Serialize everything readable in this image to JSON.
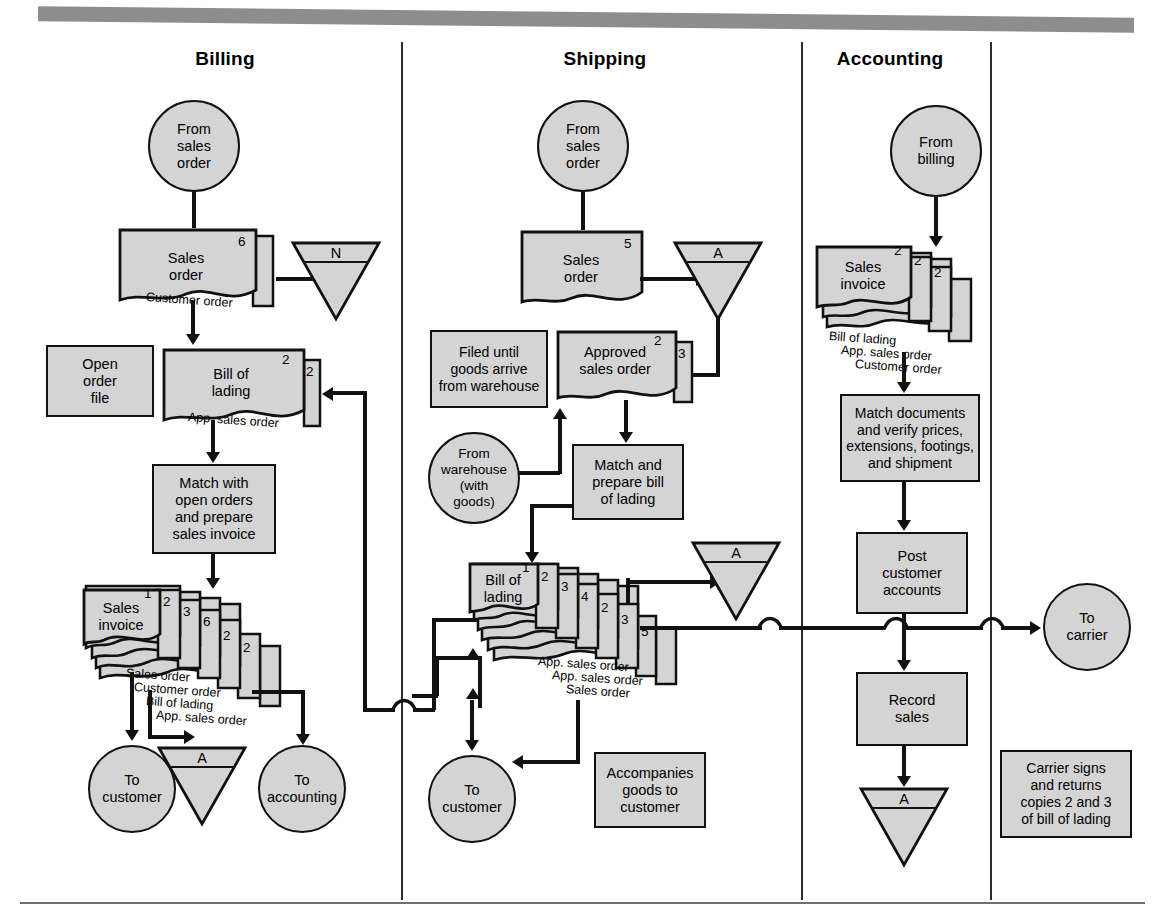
{
  "figure": {
    "columns": [
      {
        "id": "billing",
        "label": "Billing"
      },
      {
        "id": "shipping",
        "label": "Shipping"
      },
      {
        "id": "accounting",
        "label": "Accounting"
      }
    ]
  },
  "billing": {
    "from_sales_order": "From\nsales\norder",
    "sales_order_doc": {
      "title": "Sales\norder",
      "copies": [
        "6"
      ],
      "labels": [
        "Customer order"
      ]
    },
    "file_n": "N",
    "open_order_file": "Open\norder\nfile",
    "bill_of_lading_doc": {
      "title": "Bill of\nlading",
      "copies": [
        "2",
        "2"
      ],
      "labels": [
        "App. sales order"
      ]
    },
    "match_process": "Match with\nopen orders\nand prepare\nsales invoice",
    "sales_invoice_doc": {
      "title": "Sales\ninvoice",
      "copies": [
        "1",
        "2",
        "3",
        "6",
        "2",
        "2"
      ],
      "labels": [
        "Sales order",
        "Customer order",
        "Bill of lading",
        "App. sales order"
      ]
    },
    "to_customer": "To\ncustomer",
    "file_a": "A",
    "to_accounting": "To\naccounting"
  },
  "shipping": {
    "from_sales_order": "From\nsales\norder",
    "sales_order_doc": {
      "title": "Sales\norder",
      "copies": [
        "5"
      ],
      "labels": []
    },
    "file_a_top": "A",
    "filed_note": "Filed until\ngoods arrive\nfrom warehouse",
    "approved_sales_order_doc": {
      "title": "Approved\nsales order",
      "copies": [
        "2",
        "3"
      ],
      "labels": []
    },
    "from_warehouse": "From\nwarehouse\n(with\ngoods)",
    "match_prepare_bol": "Match and\nprepare bill\nof lading",
    "bill_of_lading_doc": {
      "title": "Bill of\nlading",
      "copies": [
        "1",
        "2",
        "3",
        "4",
        "2",
        "3",
        "5"
      ],
      "labels": [
        "App. sales order",
        "App. sales order",
        "Sales order"
      ]
    },
    "file_a_mid": "A",
    "to_customer": "To\ncustomer",
    "accompanies_note": "Accompanies\ngoods to\ncustomer"
  },
  "accounting": {
    "from_billing": "From\nbilling",
    "sales_invoice_doc": {
      "title": "Sales\ninvoice",
      "copies": [
        "2",
        "2",
        "2"
      ],
      "labels": [
        "Bill of lading",
        "App. sales order",
        "Customer order"
      ]
    },
    "match_documents": "Match documents\nand verify prices,\nextensions, footings,\nand shipment",
    "post_customer_accounts": "Post\ncustomer\naccounts",
    "record_sales": "Record\nsales",
    "file_a": "A",
    "to_carrier": "To\ncarrier",
    "carrier_note": "Carrier signs\nand returns\ncopies 2 and 3\nof bill of lading"
  },
  "colors": {
    "shape_fill": "#d4d4d4",
    "stroke": "#111111",
    "topbar": "#8d8d8d"
  }
}
